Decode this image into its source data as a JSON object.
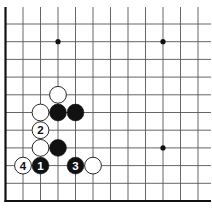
{
  "diagram": {
    "type": "go-board-fragment",
    "corner": "bottom-left",
    "visible_columns": 12,
    "visible_rows": 11,
    "colors": {
      "background": "#ffffff",
      "line": "#555555",
      "border": "#111111",
      "black": "#111111",
      "white": "#ffffff"
    },
    "hoshi": [
      {
        "col": 3,
        "row": 9
      },
      {
        "col": 9,
        "row": 9
      },
      {
        "col": 9,
        "row": 3
      }
    ],
    "stones": [
      {
        "color": "white",
        "col": 3,
        "row": 6,
        "label": ""
      },
      {
        "color": "white",
        "col": 2,
        "row": 5,
        "label": ""
      },
      {
        "color": "black",
        "col": 3,
        "row": 5,
        "label": ""
      },
      {
        "color": "black",
        "col": 4,
        "row": 5,
        "label": ""
      },
      {
        "color": "white",
        "col": 2,
        "row": 4,
        "label": "2"
      },
      {
        "color": "white",
        "col": 2,
        "row": 3,
        "label": ""
      },
      {
        "color": "black",
        "col": 3,
        "row": 3,
        "label": ""
      },
      {
        "color": "white",
        "col": 1,
        "row": 2,
        "label": "4"
      },
      {
        "color": "black",
        "col": 2,
        "row": 2,
        "label": "1"
      },
      {
        "color": "black",
        "col": 4,
        "row": 2,
        "label": "3"
      },
      {
        "color": "white",
        "col": 5,
        "row": 2,
        "label": ""
      }
    ]
  }
}
